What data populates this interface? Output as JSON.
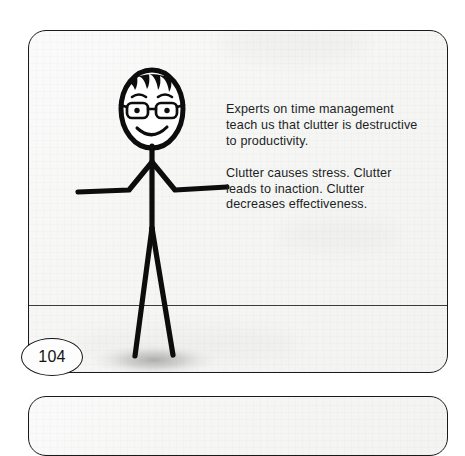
{
  "page": {
    "number": "104",
    "background_color": "#ffffff"
  },
  "panel": {
    "name": "comic-panel",
    "background_color": "#f6f6f5",
    "border_color": "#1a1a1a",
    "horizon_line_color": "#3a3a3a"
  },
  "caption": {
    "paragraph_1": "Experts on time management teach us that clutter is destructive to productivity.",
    "paragraph_2": "Clutter causes stress. Clutter leads to inaction. Clutter decreases effectiveness.",
    "text_color": "#211f1f"
  },
  "figure": {
    "label": "stick-figure-character",
    "stroke_color": "#0d0d0d",
    "shadow_color": "#b8b8b8",
    "features": [
      "head",
      "hair",
      "eyebrows",
      "eyeglasses",
      "eyes",
      "smile",
      "neck",
      "torso",
      "left-arm",
      "right-arm",
      "left-leg",
      "right-leg",
      "ground-shadow"
    ]
  },
  "next_panel": {
    "label": "next-comic-panel"
  }
}
